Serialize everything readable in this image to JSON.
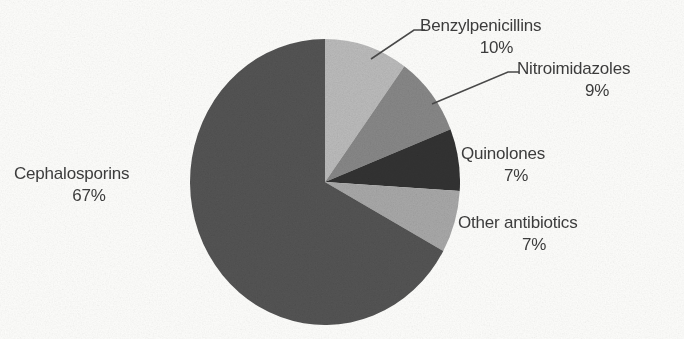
{
  "chart_data": {
    "type": "pie",
    "title": "",
    "subtitle": "",
    "xlabel": "",
    "ylabel": "",
    "legend_position": "none",
    "grid": false,
    "labels_show_percent": true,
    "start_angle_deg": 0,
    "direction": "clockwise",
    "categories": [
      "Benzylpenicillins",
      "Nitroimidazoles",
      "Quinolones",
      "Other antibiotics",
      "Cephalosporins"
    ],
    "values": [
      10,
      9,
      7,
      7,
      67
    ],
    "value_labels": [
      "10%",
      "9%",
      "7%",
      "7%",
      "67%"
    ],
    "colors": [
      "#bebebe",
      "#8a8a8a",
      "#333333",
      "#ababab",
      "#555555"
    ],
    "slices": [
      {
        "name": "Benzylpenicillins",
        "percent_label": "10%",
        "value": 10,
        "color": "#bebebe",
        "has_leader_line": true
      },
      {
        "name": "Nitroimidazoles",
        "percent_label": "9%",
        "value": 9,
        "color": "#8a8a8a",
        "has_leader_line": true
      },
      {
        "name": "Quinolones",
        "percent_label": "7%",
        "value": 7,
        "color": "#333333",
        "has_leader_line": false
      },
      {
        "name": "Other antibiotics",
        "percent_label": "7%",
        "value": 7,
        "color": "#ababab",
        "has_leader_line": false
      },
      {
        "name": "Cephalosporins",
        "percent_label": "67%",
        "value": 67,
        "color": "#555555",
        "has_leader_line": false
      }
    ]
  },
  "geometry": {
    "center_x": 325,
    "center_y": 182,
    "radius_x": 135,
    "radius_y": 143
  },
  "style": {
    "background": "#fdfdfb",
    "text_color": "#3d3d3d",
    "leader_line_color": "#4a4a4a"
  }
}
